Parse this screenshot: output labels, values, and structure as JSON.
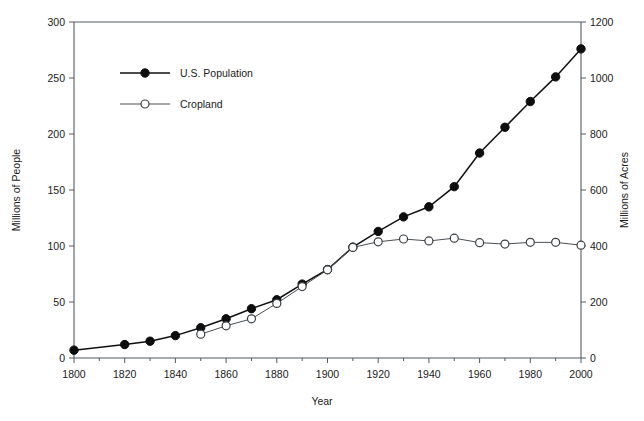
{
  "chart_data": {
    "type": "line",
    "title": "",
    "xlabel": "Year",
    "ylabel": "Millions of People",
    "y2label": "Millions of Acres",
    "xlim": [
      1800,
      2000
    ],
    "ylim": [
      0,
      300
    ],
    "y2lim": [
      0,
      1200
    ],
    "xticks": [
      1800,
      1820,
      1840,
      1860,
      1880,
      1900,
      1920,
      1940,
      1960,
      1980,
      2000
    ],
    "xtick_labels": [
      "1800",
      "1820",
      "1840",
      "1860",
      "1880",
      "1900",
      "1920",
      "1940",
      "1960",
      "1980",
      "2000"
    ],
    "x_minor_ticks": [
      1810,
      1830,
      1850,
      1870,
      1890,
      1910,
      1930,
      1950,
      1970,
      1990
    ],
    "yticks": [
      0,
      50,
      100,
      150,
      200,
      250,
      300
    ],
    "ytick_labels": [
      "0",
      "50",
      "100",
      "150",
      "200",
      "250",
      "300"
    ],
    "y2ticks": [
      0,
      200,
      400,
      600,
      800,
      1000,
      1200
    ],
    "y2tick_labels": [
      "0",
      "200",
      "400",
      "600",
      "800",
      "1000",
      "1200"
    ],
    "grid": false,
    "legend_position": "upper-left-inside",
    "series": [
      {
        "name": "U.S. Population",
        "axis": "left",
        "units": "millions of people",
        "marker": "filled-circle",
        "color": "#101010",
        "x": [
          1800,
          1820,
          1830,
          1840,
          1850,
          1860,
          1870,
          1880,
          1890,
          1900,
          1910,
          1920,
          1930,
          1940,
          1950,
          1960,
          1970,
          1980,
          1990,
          2000
        ],
        "values": [
          7,
          12,
          15,
          20,
          27,
          35,
          44,
          52,
          66,
          79,
          99,
          113,
          126,
          135,
          153,
          183,
          206,
          229,
          251,
          276
        ]
      },
      {
        "name": "Cropland",
        "axis": "right",
        "units": "millions of acres",
        "marker": "open-circle",
        "color": "#4a4f54",
        "x": [
          1850,
          1860,
          1870,
          1880,
          1890,
          1900,
          1910,
          1920,
          1930,
          1940,
          1950,
          1960,
          1970,
          1980,
          1990,
          2000
        ],
        "values": [
          85,
          115,
          140,
          195,
          255,
          315,
          395,
          415,
          425,
          418,
          428,
          412,
          407,
          413,
          413,
          403
        ]
      }
    ],
    "legend": [
      {
        "label": "U.S. Population",
        "marker": "filled-circle"
      },
      {
        "label": "Cropland",
        "marker": "open-circle"
      }
    ]
  }
}
